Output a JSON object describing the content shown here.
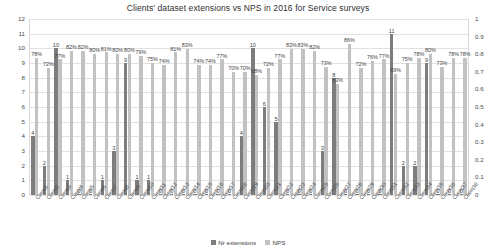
{
  "chart_data": {
    "type": "bar",
    "title": "Clients' dataset extensions vs NPS in 2016 for Service surveys",
    "xlabel": "",
    "ylabel": "",
    "ylim": [
      0,
      12
    ],
    "y2lim": [
      0,
      1
    ],
    "grid": true,
    "legend_position": "bottom",
    "left_ticks": [
      "0",
      "1",
      "2",
      "3",
      "4",
      "5",
      "6",
      "7",
      "8",
      "9",
      "10",
      "11",
      "12"
    ],
    "right_ticks": [
      "0",
      "0.1",
      "0.2",
      "0.3",
      "0.4",
      "0.5",
      "0.6",
      "0.7",
      "0.8",
      "0.9",
      "1"
    ],
    "categories": [
      "Client1",
      "Client2",
      "Client3",
      "Client4",
      "Client5",
      "Client6",
      "Client7",
      "Client8",
      "Client9",
      "Client10",
      "Client11",
      "Client12",
      "Client13",
      "Client14",
      "Client15",
      "Client16",
      "Client17",
      "Client18",
      "Client19",
      "Client20",
      "Client21",
      "Client22",
      "Client23",
      "Client24",
      "Client25",
      "Client26",
      "Client27",
      "Client28",
      "Client29",
      "Client30",
      "Client31",
      "Client32",
      "Client33",
      "Client34",
      "Client35",
      "Client36",
      "Client37",
      "Client38"
    ],
    "series": [
      {
        "name": "Nr extensions",
        "axis": "left",
        "color": "#7d7d7d",
        "values": [
          4,
          2,
          10,
          1,
          0,
          0,
          1,
          3,
          9,
          1,
          1,
          0,
          0,
          0,
          0,
          0,
          0,
          0,
          4,
          10,
          6,
          5,
          0,
          0,
          0,
          3,
          8,
          0,
          0,
          0,
          0,
          11,
          2,
          2,
          9,
          0,
          0,
          0
        ],
        "labels": [
          "4",
          "2",
          "10",
          "1",
          "0",
          "0",
          "1",
          "3",
          "9",
          "1",
          "1",
          "0",
          "0",
          "0",
          "0",
          "0",
          "0",
          "0",
          "4",
          "10",
          "6",
          "5",
          "0",
          "0",
          "0",
          "3",
          "8",
          "0",
          "0",
          "0",
          "0",
          "11",
          "2",
          "2",
          "9",
          "0",
          "0",
          "0"
        ]
      },
      {
        "name": "NPS",
        "axis": "right",
        "color": "#c2c2c2",
        "values": [
          0.78,
          0.72,
          0.77,
          0.82,
          0.82,
          0.8,
          0.81,
          0.8,
          0.8,
          0.79,
          0.75,
          0.74,
          0.81,
          0.83,
          0.74,
          0.74,
          0.77,
          0.7,
          0.7,
          0.68,
          0.72,
          0.77,
          0.83,
          0.83,
          0.82,
          0.73,
          0.63,
          0.86,
          0.72,
          0.76,
          0.77,
          0.69,
          0.75,
          0.78,
          0.8,
          0.73,
          0.78,
          0.78
        ],
        "labels": [
          "78%",
          "72%",
          "77%",
          "82%",
          "82%",
          "80%",
          "81%",
          "80%",
          "80%",
          "79%",
          "75%",
          "74%",
          "81%",
          "83%",
          "74%",
          "74%",
          "77%",
          "70%",
          "70%",
          "68%",
          "72%",
          "77%",
          "83%",
          "83%",
          "82%",
          "73%",
          "63%",
          "86%",
          "72%",
          "76%",
          "77%",
          "69%",
          "75%",
          "78%",
          "80%",
          "73%",
          "78%",
          "78%"
        ]
      }
    ]
  }
}
